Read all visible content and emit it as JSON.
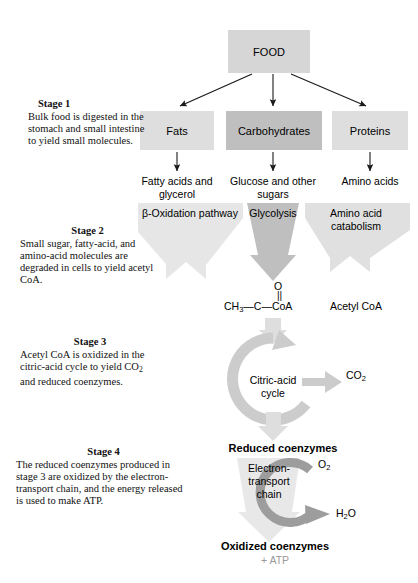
{
  "figure": {
    "background": "#ffffff"
  },
  "colors": {
    "box_light": "#d9d9d9",
    "box_mid": "#bdbdbd",
    "arrow_pale": "#e2e2e2",
    "arrow_mid": "#cfcfcf",
    "arrow_dark": "#a8a8a8",
    "text": "#000000",
    "text_gray": "#9a9a9a"
  },
  "stages": [
    {
      "id": "stage1",
      "heading": "Stage 1",
      "body": "Bulk food is digested in the stomach and small intestine to yield small molecules."
    },
    {
      "id": "stage2",
      "heading": "Stage 2",
      "body": "Small sugar, fatty-acid, and amino-acid molecules are degraded in cells to yield acetyl CoA."
    },
    {
      "id": "stage3",
      "heading": "Stage 3",
      "body_pre": "Acetyl CoA is oxidized in the citric-acid cycle to yield CO",
      "body_sub": "2",
      "body_post": " and reduced coenzymes."
    },
    {
      "id": "stage4",
      "heading": "Stage 4",
      "body": "The reduced coenzymes produced in stage 3 are oxidized by the electron-transport chain, and the energy released is used to make ATP."
    }
  ],
  "nodes": {
    "food": "FOOD",
    "fats": "Fats",
    "carbohydrates": "Carbohydrates",
    "proteins": "Proteins"
  },
  "products": {
    "fatty_acids": "Fatty acids and glycerol",
    "glucose": "Glucose and other sugars",
    "amino_acids": "Amino acids"
  },
  "pathways": {
    "beta_oxidation": "β-Oxidation pathway",
    "glycolysis": "Glycolysis",
    "amino_catabolism": "Amino acid catabolism"
  },
  "acetyl": {
    "oxygen": "O",
    "double_bond": "||",
    "formula_pre": "CH",
    "formula_sub": "3",
    "formula_post": "—C—CoA",
    "name": "Acetyl CoA"
  },
  "cycle": {
    "label_line1": "Citric-acid",
    "label_line2": "cycle",
    "co2_pre": "CO",
    "co2_sub": "2"
  },
  "etc": {
    "reduced": "Reduced coenzymes",
    "chain_line1": "Electron-",
    "chain_line2": "transport",
    "chain_line3": "chain",
    "o2_pre": "O",
    "o2_sub": "2",
    "h2o_pre": "H",
    "h2o_sub": "2",
    "h2o_post": "O",
    "oxidized": "Oxidized coenzymes",
    "atp": "+ ATP"
  }
}
